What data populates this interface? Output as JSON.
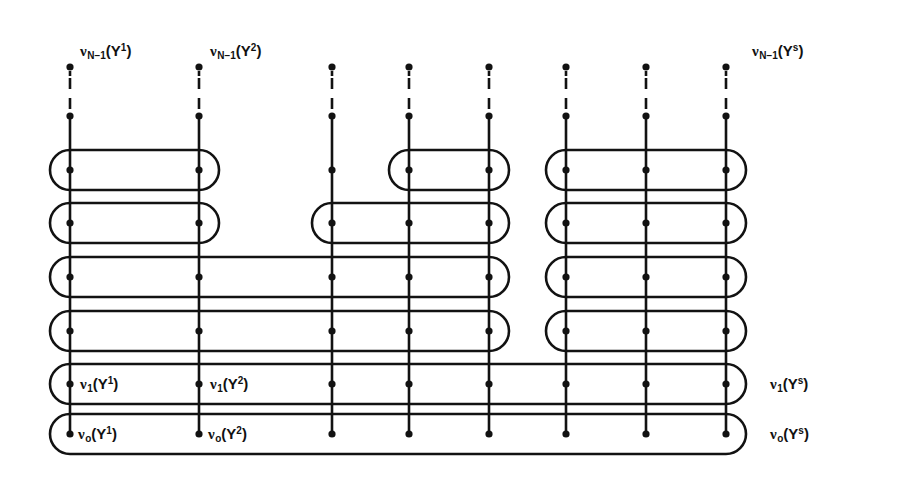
{
  "figure": {
    "stroke_color": "#121212",
    "background_color": "#ffffff",
    "dot_radius": 3.6,
    "line_width": 2.6,
    "columns": [
      {
        "id": "col1",
        "x": 70
      },
      {
        "id": "col2",
        "x": 199
      },
      {
        "id": "col3",
        "x": 332
      },
      {
        "id": "col4",
        "x": 409
      },
      {
        "id": "col5",
        "x": 489
      },
      {
        "id": "col6",
        "x": 566
      },
      {
        "id": "col7",
        "x": 646
      },
      {
        "id": "col8",
        "x": 726
      }
    ],
    "rows": [
      {
        "id": "row_top",
        "y": 67,
        "kind": "terminal"
      },
      {
        "id": "row_next",
        "y": 116,
        "kind": "terminal"
      },
      {
        "id": "row_a",
        "y": 170,
        "kind": "loop"
      },
      {
        "id": "row_b",
        "y": 223,
        "kind": "loop"
      },
      {
        "id": "row_c",
        "y": 277,
        "kind": "loop"
      },
      {
        "id": "row_d",
        "y": 331,
        "kind": "loop"
      },
      {
        "id": "row_e",
        "y": 384,
        "kind": "loop"
      },
      {
        "id": "row_f",
        "y": 434,
        "kind": "loop"
      }
    ],
    "column_lines": [
      {
        "column": "col1",
        "y_top": 67,
        "y_bottom": 434,
        "dashed_segment": [
          78,
          110
        ]
      },
      {
        "column": "col2",
        "y_top": 67,
        "y_bottom": 434,
        "dashed_segment": [
          78,
          110
        ]
      },
      {
        "column": "col3",
        "y_top": 67,
        "y_bottom": 434,
        "dashed_segment": [
          78,
          110
        ]
      },
      {
        "column": "col4",
        "y_top": 67,
        "y_bottom": 434,
        "dashed_segment": [
          78,
          110
        ]
      },
      {
        "column": "col5",
        "y_top": 67,
        "y_bottom": 434,
        "dashed_segment": [
          78,
          110
        ]
      },
      {
        "column": "col6",
        "y_top": 67,
        "y_bottom": 434,
        "dashed_segment": [
          78,
          110
        ]
      },
      {
        "column": "col7",
        "y_top": 67,
        "y_bottom": 434,
        "dashed_segment": [
          78,
          110
        ]
      },
      {
        "column": "col8",
        "y_top": 67,
        "y_bottom": 434,
        "dashed_segment": [
          78,
          110
        ]
      }
    ],
    "loops": [
      {
        "id": "loop-a-1",
        "row": "row_a",
        "from_x": 70,
        "to_x": 199,
        "y": 170
      },
      {
        "id": "loop-a-2",
        "row": "row_a",
        "from_x": 409,
        "to_x": 489,
        "y": 170
      },
      {
        "id": "loop-a-3",
        "row": "row_a",
        "from_x": 566,
        "to_x": 726,
        "y": 170
      },
      {
        "id": "loop-b-1",
        "row": "row_b",
        "from_x": 70,
        "to_x": 199,
        "y": 223
      },
      {
        "id": "loop-b-2",
        "row": "row_b",
        "from_x": 332,
        "to_x": 489,
        "y": 223
      },
      {
        "id": "loop-b-3",
        "row": "row_b",
        "from_x": 566,
        "to_x": 726,
        "y": 223
      },
      {
        "id": "loop-c-1",
        "row": "row_c",
        "from_x": 70,
        "to_x": 489,
        "y": 277
      },
      {
        "id": "loop-c-2",
        "row": "row_c",
        "from_x": 566,
        "to_x": 726,
        "y": 277
      },
      {
        "id": "loop-d-1",
        "row": "row_d",
        "from_x": 70,
        "to_x": 489,
        "y": 331
      },
      {
        "id": "loop-d-2",
        "row": "row_d",
        "from_x": 566,
        "to_x": 726,
        "y": 331
      },
      {
        "id": "loop-e-1",
        "row": "row_e",
        "from_x": 70,
        "to_x": 726,
        "y": 384
      },
      {
        "id": "loop-f-1",
        "row": "row_f",
        "from_x": 70,
        "to_x": 726,
        "y": 434
      }
    ],
    "labels": [
      {
        "id": "label-nu-N1-Y1",
        "x": 80,
        "y": 42,
        "nu": "ν",
        "sub": "N−1",
        "open": "(Y",
        "sup": "1",
        "close": ")",
        "text": "ν_{N−1}(Y^1)"
      },
      {
        "id": "label-nu-N1-Y2",
        "x": 210,
        "y": 42,
        "nu": "ν",
        "sub": "N−1",
        "open": "(Y",
        "sup": "2",
        "close": ")",
        "text": "ν_{N−1}(Y^2)"
      },
      {
        "id": "label-nu-N1-Ys",
        "x": 752,
        "y": 42,
        "nu": "ν",
        "sub": "N−1",
        "open": "(Y",
        "sup": "s",
        "close": ")",
        "text": "ν_{N−1}(Y^s)"
      },
      {
        "id": "label-nu-1-Y1",
        "x": 80,
        "y": 375,
        "nu": "ν",
        "sub": "1",
        "open": "(Y",
        "sup": "1",
        "close": ")",
        "text": "ν_1(Y^1)"
      },
      {
        "id": "label-nu-1-Y2",
        "x": 210,
        "y": 375,
        "nu": "ν",
        "sub": "1",
        "open": "(Y",
        "sup": "2",
        "close": ")",
        "text": "ν_1(Y^2)"
      },
      {
        "id": "label-nu-1-Ys",
        "x": 770,
        "y": 375,
        "nu": "ν",
        "sub": "1",
        "open": "(Y",
        "sup": "s",
        "close": ")",
        "text": "ν_1(Y^s)"
      },
      {
        "id": "label-nu-0-Y1",
        "x": 78,
        "y": 425,
        "nu": "ν",
        "sub": "o",
        "open": "(Y",
        "sup": "1",
        "close": ")",
        "text": "ν_o(Y^1)"
      },
      {
        "id": "label-nu-0-Y2",
        "x": 208,
        "y": 425,
        "nu": "ν",
        "sub": "o",
        "open": "(Y",
        "sup": "2",
        "close": ")",
        "text": "ν_o(Y^2)"
      },
      {
        "id": "label-nu-0-Ys",
        "x": 770,
        "y": 425,
        "nu": "ν",
        "sub": "o",
        "open": "(Y",
        "sup": "s",
        "close": ")",
        "text": "ν_o(Y^s)"
      }
    ]
  }
}
